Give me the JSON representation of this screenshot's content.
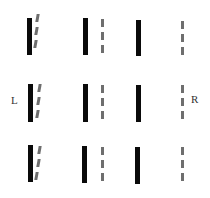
{
  "labels": {
    "left": "L",
    "right": "R"
  },
  "colors": {
    "solid_bar": "#0a0a0a",
    "dashed_bar": "#6e6e6e",
    "background": "#ffffff"
  },
  "layout": {
    "rows": 3,
    "columns": [
      {
        "name": "col1",
        "type": "solid+tilted-dashed"
      },
      {
        "name": "col2",
        "type": "solid+dashed"
      },
      {
        "name": "col3",
        "type": "solid"
      },
      {
        "name": "col4",
        "type": "dashed"
      }
    ]
  }
}
